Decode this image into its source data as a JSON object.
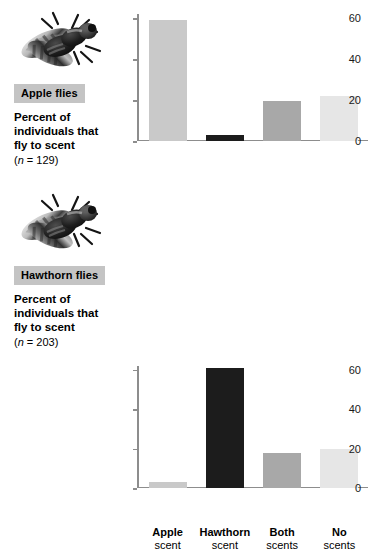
{
  "figure": {
    "panels": [
      {
        "id": "apple",
        "species_tag": "Apple flies",
        "photo_icon": "fly-photo-icon",
        "caption_line1": "Percent of",
        "caption_line2": "individuals that",
        "caption_line3": "fly to scent",
        "sample_size_text": "(n = 129)",
        "sample_size_n_italic": "n",
        "sample_size_value": "129"
      },
      {
        "id": "hawthorn",
        "species_tag": "Hawthorn flies",
        "photo_icon": "fly-photo-icon",
        "caption_line1": "Percent of",
        "caption_line2": "individuals that",
        "caption_line3": "fly to scent",
        "sample_size_text": "(n = 203)",
        "sample_size_n_italic": "n",
        "sample_size_value": "203"
      }
    ]
  },
  "colors": {
    "bar_light": "#c9c9c9",
    "bar_black": "#1c1c1c",
    "bar_medium": "#a8a8a8",
    "bar_pale": "#e6e6e6",
    "axis": "#8d8d8d",
    "tag_background": "#c4c4c4",
    "text": "#000000"
  },
  "chart_data": [
    {
      "type": "bar",
      "id": "apple-flies-chart",
      "title": "Apple flies",
      "xlabel": "",
      "ylabel": "Percent of individuals that fly to scent",
      "ylim": [
        0,
        62
      ],
      "yticks": [
        0,
        20,
        40,
        60
      ],
      "ytick_labels": [
        "0",
        "20",
        "40",
        "60"
      ],
      "grid": false,
      "legend": false,
      "sample_size": 129,
      "categories": [
        "Apple scent",
        "Hawthorn scent",
        "Both scents",
        "No scents"
      ],
      "category_lines": [
        [
          "Apple",
          "scent"
        ],
        [
          "Hawthorn",
          "scent"
        ],
        [
          "Both",
          "scents"
        ],
        [
          "No",
          "scents"
        ]
      ],
      "values": [
        59,
        3,
        19.5,
        22
      ],
      "bar_colors": [
        "#c9c9c9",
        "#1c1c1c",
        "#a8a8a8",
        "#e6e6e6"
      ]
    },
    {
      "type": "bar",
      "id": "hawthorn-flies-chart",
      "title": "Hawthorn flies",
      "xlabel": "",
      "ylabel": "Percent of individuals that fly to scent",
      "ylim": [
        0,
        62
      ],
      "yticks": [
        0,
        20,
        40,
        60
      ],
      "ytick_labels": [
        "0",
        "20",
        "40",
        "60"
      ],
      "grid": false,
      "legend": false,
      "sample_size": 203,
      "categories": [
        "Apple scent",
        "Hawthorn scent",
        "Both scents",
        "No scents"
      ],
      "category_lines": [
        [
          "Apple",
          "scent"
        ],
        [
          "Hawthorn",
          "scent"
        ],
        [
          "Both",
          "scents"
        ],
        [
          "No",
          "scents"
        ]
      ],
      "values": [
        3,
        61,
        18,
        20
      ],
      "bar_colors": [
        "#c9c9c9",
        "#1c1c1c",
        "#a8a8a8",
        "#e6e6e6"
      ]
    }
  ]
}
